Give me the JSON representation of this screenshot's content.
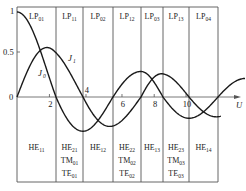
{
  "figure": {
    "y_axis": {
      "ticks": [
        {
          "value": 1,
          "label": "1"
        },
        {
          "value": 0.5,
          "label": "0.5"
        }
      ],
      "origin_label": "0"
    },
    "x_axis": {
      "label": "U",
      "ticks": [
        {
          "value": 2,
          "label": "2"
        },
        {
          "value": 4,
          "label": "4"
        },
        {
          "value": 6,
          "label": "6"
        },
        {
          "value": 8,
          "label": "8"
        },
        {
          "value": 10,
          "label": "10"
        }
      ]
    },
    "curve_labels": {
      "j0": "J",
      "j0_sub": "0",
      "j1": "J",
      "j1_sub": "1"
    },
    "lp_regions": [
      {
        "base": "LP",
        "sub": "01"
      },
      {
        "base": "LP",
        "sub": "11"
      },
      {
        "base": "LP",
        "sub": "02"
      },
      {
        "base": "LP",
        "sub": "12"
      },
      {
        "base": "LP",
        "sub": "03"
      },
      {
        "base": "LP",
        "sub": "13"
      },
      {
        "base": "LP",
        "sub": "04"
      }
    ],
    "he_regions": [
      [
        {
          "base": "HE",
          "sub": "11"
        }
      ],
      [
        {
          "base": "HE",
          "sub": "21"
        },
        {
          "base": "TM",
          "sub": "01"
        },
        {
          "base": "TE",
          "sub": "01"
        }
      ],
      [
        {
          "base": "HE",
          "sub": "12"
        }
      ],
      [
        {
          "base": "HE",
          "sub": "22"
        },
        {
          "base": "TM",
          "sub": "02"
        },
        {
          "base": "TE",
          "sub": "02"
        }
      ],
      [
        {
          "base": "HE",
          "sub": "13"
        }
      ],
      [
        {
          "base": "HE",
          "sub": "23"
        },
        {
          "base": "TM",
          "sub": "03"
        },
        {
          "base": "TE",
          "sub": "03"
        }
      ],
      [
        {
          "base": "HE",
          "sub": "14"
        }
      ]
    ],
    "cutoffs": [
      0,
      2.405,
      3.832,
      5.52,
      7.016,
      8.654,
      10.173,
      11.792
    ]
  },
  "chart_data": {
    "type": "line",
    "title": "",
    "xlabel": "U",
    "ylabel": "",
    "xlim": [
      0,
      13.5
    ],
    "ylim": [
      -0.45,
      1.05
    ],
    "series": [
      {
        "name": "J0",
        "description": "Bessel function J0(U)",
        "zeros": [
          2.405,
          5.52,
          8.654,
          11.792
        ]
      },
      {
        "name": "J1",
        "description": "Bessel function J1(U)",
        "zeros": [
          0,
          3.832,
          7.016,
          10.173
        ]
      }
    ],
    "regions_top": [
      "LP01",
      "LP11",
      "LP02",
      "LP12",
      "LP03",
      "LP13",
      "LP04"
    ],
    "regions_bottom": [
      "HE11",
      "HE21/TM01/TE01",
      "HE12",
      "HE22/TM02/TE02",
      "HE13",
      "HE23/TM03/TE03",
      "HE14"
    ],
    "boundaries": [
      0,
      2.405,
      3.832,
      5.52,
      7.016,
      8.654,
      10.173,
      11.792
    ]
  }
}
